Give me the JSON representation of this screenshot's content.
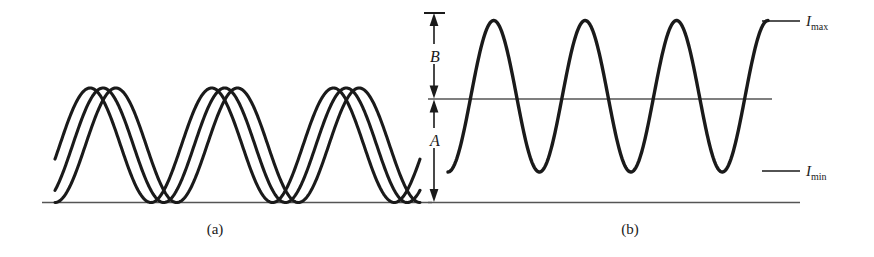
{
  "figure": {
    "background_color": "#ffffff",
    "stroke_color": "#1a1a1a",
    "axis_color": "#555555",
    "width": 874,
    "height": 257
  },
  "panels": [
    {
      "id": "a",
      "caption": "(a)",
      "description": "Three mutually phase-shifted fringe intensity curves sharing a common baseline"
    },
    {
      "id": "b",
      "caption": "(b)",
      "description": "Single fringe intensity curve with bias A, modulation B, and the I max / I min levels marked"
    }
  ],
  "labels": {
    "dim_B": "B",
    "dim_A": "A",
    "level_max_symbol": "I",
    "level_max_subscript": "max",
    "level_min_symbol": "I",
    "level_min_subscript": "min"
  },
  "chart_data": [
    {
      "type": "line",
      "panel": "a",
      "title": "(a)",
      "xlabel": "",
      "ylabel": "",
      "grid": false,
      "legend": null,
      "xlim": [
        0,
        1
      ],
      "ylim": [
        0,
        1
      ],
      "baseline_y_value": 0,
      "series": [
        {
          "name": "fringe-curve-1",
          "waveform": "raised-cosine",
          "cycles": 3,
          "phase_deg": 0,
          "min_value": 0,
          "max_value": 1
        },
        {
          "name": "fringe-curve-2",
          "waveform": "raised-cosine",
          "cycles": 3,
          "phase_deg": 38,
          "min_value": 0,
          "max_value": 1
        },
        {
          "name": "fringe-curve-3",
          "waveform": "raised-cosine",
          "cycles": 3,
          "phase_deg": 76,
          "min_value": 0,
          "max_value": 1
        }
      ]
    },
    {
      "type": "line",
      "panel": "b",
      "title": "(b)",
      "xlabel": "",
      "ylabel": "",
      "grid": false,
      "legend": null,
      "xlim": [
        0,
        1
      ],
      "ylim": [
        0,
        1
      ],
      "baseline_y_value": 0,
      "annotations": [
        {
          "name": "I_max",
          "y_value": 0.895,
          "text": "I max"
        },
        {
          "name": "I_min",
          "y_value": 0.148,
          "text": "I min"
        },
        {
          "name": "mid-line",
          "y_value": 0.508,
          "text": ""
        },
        {
          "name": "bias-A",
          "from_value": 0.0,
          "to_value": 0.508,
          "text": "A"
        },
        {
          "name": "modulation-B",
          "from_value": 0.508,
          "to_value": 0.955,
          "text": "B"
        }
      ],
      "series": [
        {
          "name": "fringe-curve",
          "waveform": "raised-cosine",
          "cycles": 3.5,
          "phase_deg": 0,
          "min_value": 0.148,
          "max_value": 0.895
        }
      ]
    }
  ]
}
